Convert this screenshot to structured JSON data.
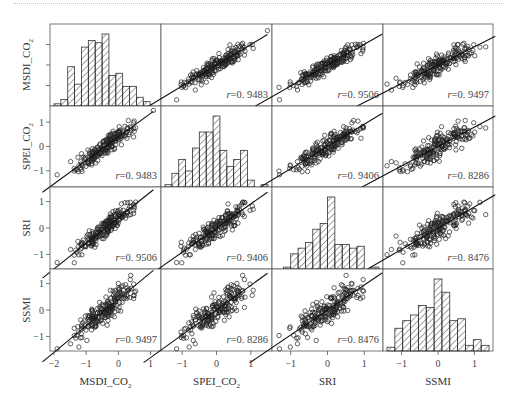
{
  "chart_data": {
    "type": "scatter_matrix",
    "title": "",
    "variables": [
      "MSDI_CO2",
      "SPEI_CO2",
      "SRI",
      "SSMI"
    ],
    "variable_labels": [
      {
        "main": "MSDI_CO",
        "sub": "2"
      },
      {
        "main": "SPEI_CO",
        "sub": "2"
      },
      {
        "main": "SRI",
        "sub": ""
      },
      {
        "main": "SSMI",
        "sub": ""
      }
    ],
    "axis_ranges": {
      "MSDI_CO2": [
        -2.0,
        1.2
      ],
      "SPEI_CO2": [
        -1.5,
        1.5
      ],
      "SRI": [
        -1.4,
        1.4
      ],
      "SSMI": [
        -1.4,
        1.4
      ]
    },
    "x_ticks": {
      "MSDI_CO2": [
        -2,
        -1,
        0,
        1
      ],
      "SPEI_CO2": [
        -1,
        0,
        1
      ],
      "SRI": [
        -1,
        0,
        1
      ],
      "SSMI": [
        -1,
        0,
        1
      ]
    },
    "x_tick_labels": {
      "MSDI_CO2": [
        "−2",
        "−1",
        "0",
        "1"
      ],
      "SPEI_CO2": [
        "−1",
        "0",
        "1"
      ],
      "SRI": [
        "−1",
        "0",
        "1"
      ],
      "SSMI": [
        "−1",
        "0",
        "1"
      ]
    },
    "y_ticks": {
      "SPEI_CO2": [
        -1,
        0,
        1
      ],
      "SRI": [
        -1,
        0,
        1
      ],
      "SSMI": [
        -1,
        0,
        1
      ]
    },
    "y_tick_labels": {
      "SPEI_CO2": [
        "−1",
        "0",
        "1"
      ],
      "SRI": [
        "−1",
        "0",
        "1"
      ],
      "SSMI": [
        "−1",
        "0",
        "1"
      ]
    },
    "correlation_matrix": [
      [
        1.0,
        0.9483,
        0.9506,
        0.9497
      ],
      [
        0.9483,
        1.0,
        0.9406,
        0.8286
      ],
      [
        0.9506,
        0.9406,
        1.0,
        0.8476
      ],
      [
        0.9497,
        0.8286,
        0.8476,
        1.0
      ]
    ],
    "correlation_labels": {
      "MSDI_CO2-SPEI_CO2": "r=0. 9483",
      "MSDI_CO2-SRI": "r=0. 9506",
      "MSDI_CO2-SSMI": "r=0. 9497",
      "SPEI_CO2-SRI": "r=0. 9406",
      "SPEI_CO2-SSMI": "r=0. 8286",
      "SRI-SSMI": "r=0. 8476"
    },
    "histograms": {
      "MSDI_CO2": {
        "counts": [
          1,
          3,
          18,
          10,
          27,
          30,
          29,
          33,
          14,
          15,
          9,
          9,
          4,
          2,
          0
        ],
        "hatch": "diagonal"
      },
      "SPEI_CO2": {
        "counts": [
          1,
          6,
          12,
          7,
          17,
          24,
          24,
          31,
          16,
          9,
          12,
          16,
          3,
          0,
          1
        ],
        "hatch": "diagonal"
      },
      "SRI": {
        "counts": [
          0,
          1,
          8,
          11,
          14,
          21,
          24,
          38,
          13,
          13,
          11,
          12,
          0,
          1
        ],
        "hatch": "diagonal"
      },
      "SSMI": {
        "counts": [
          2,
          12,
          16,
          19,
          24,
          23,
          38,
          31,
          16,
          17,
          3,
          6,
          3
        ],
        "hatch": "diagonal"
      }
    },
    "scatter": {
      "marker": "open-circle",
      "points_per_panel": 200,
      "fit_line": "linear"
    },
    "grid": false,
    "legend": null
  }
}
